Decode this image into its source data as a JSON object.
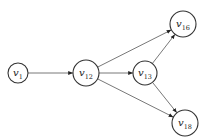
{
  "diagram": {
    "type": "directed-graph",
    "nodes": [
      {
        "id": "v1",
        "base": "v",
        "sub": "1",
        "x": 18,
        "y": 73,
        "r": 10
      },
      {
        "id": "v12",
        "base": "v",
        "sub": "12",
        "x": 86,
        "y": 73,
        "r": 13
      },
      {
        "id": "v13",
        "base": "v",
        "sub": "13",
        "x": 145,
        "y": 73,
        "r": 12
      },
      {
        "id": "v16",
        "base": "v",
        "sub": "16",
        "x": 183,
        "y": 24,
        "r": 13
      },
      {
        "id": "v18",
        "base": "v",
        "sub": "18",
        "x": 185,
        "y": 123,
        "r": 13
      }
    ],
    "edges": [
      {
        "from": "v1",
        "to": "v12"
      },
      {
        "from": "v12",
        "to": "v13"
      },
      {
        "from": "v12",
        "to": "v16"
      },
      {
        "from": "v12",
        "to": "v18"
      },
      {
        "from": "v13",
        "to": "v16"
      },
      {
        "from": "v13",
        "to": "v18"
      }
    ],
    "colors": {
      "stroke": "#333333",
      "edge": "#555555",
      "background": "#ffffff"
    }
  }
}
